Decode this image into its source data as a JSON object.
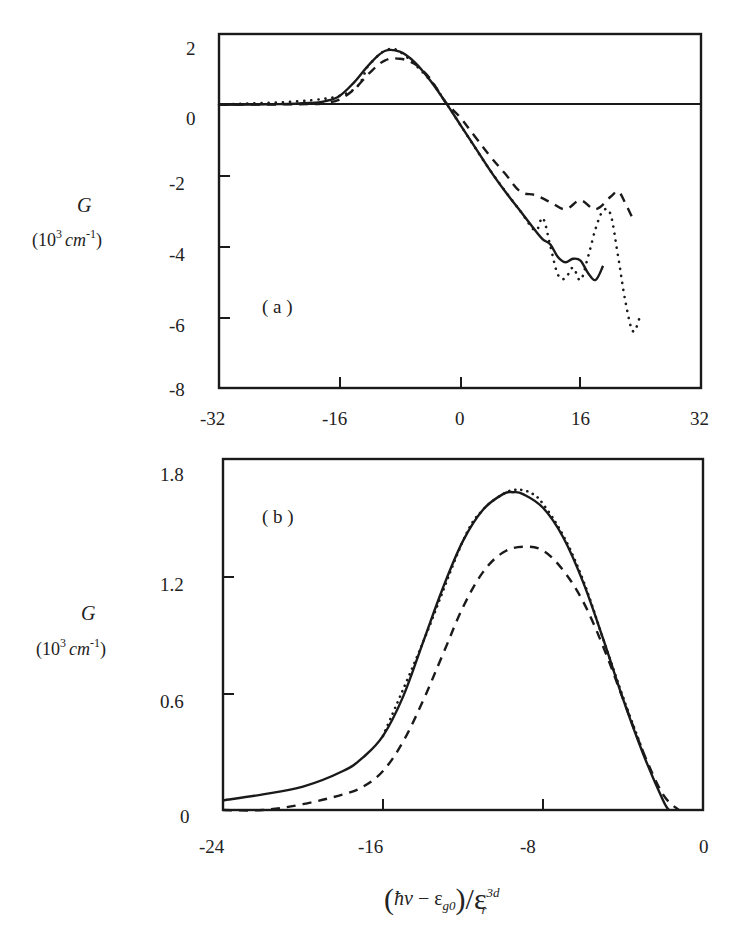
{
  "figure": {
    "panel_a": {
      "tag": "( a )",
      "ylabel_symbol": "G",
      "ylabel_unit_prefix": "(10",
      "ylabel_unit_exp": "3",
      "ylabel_unit_mid": "cm",
      "ylabel_unit_exp2": "-1",
      "ylabel_unit_suffix": ")",
      "xticks": [
        "-32",
        "-16",
        "0",
        "16",
        "32"
      ],
      "yticks": [
        "2",
        "0",
        "-2",
        "-4",
        "-6",
        "-8"
      ]
    },
    "panel_b": {
      "tag": "( b )",
      "ylabel_symbol": "G",
      "ylabel_unit_prefix": "(10",
      "ylabel_unit_exp": "3",
      "ylabel_unit_mid": "cm",
      "ylabel_unit_exp2": "-1",
      "ylabel_unit_suffix": ")",
      "xticks": [
        "-24",
        "-16",
        "-8",
        "0"
      ],
      "yticks": [
        "1.8",
        "1.2",
        "0.6",
        "0"
      ]
    },
    "xlabel": {
      "open": "(",
      "hbar_nu": "ħν",
      "minus": " − ε",
      "sub_g0": "g0",
      "close_div": ")/ε",
      "sup_3d": "3d",
      "sub_r": "r"
    },
    "line_color": "#1a1a1a"
  },
  "chart_data": [
    {
      "panel": "a",
      "type": "line",
      "title": "",
      "xlabel": "(ħν − ε_g0)/ε_r^3d",
      "ylabel": "G (10^3 cm^-1)",
      "xlim": [
        -32,
        32
      ],
      "ylim": [
        -8,
        2
      ],
      "xticks": [
        -32,
        -16,
        0,
        16,
        32
      ],
      "yticks": [
        2,
        0,
        -2,
        -4,
        -6,
        -8
      ],
      "grid": false,
      "reference_line": {
        "y": 0,
        "style": "solid"
      },
      "annotation": "(a)",
      "series": [
        {
          "name": "solid",
          "style": "solid",
          "x": [
            -32,
            -24,
            -20,
            -18,
            -16,
            -14,
            -12,
            -10,
            -8,
            -6,
            -4,
            -2,
            0,
            2,
            4,
            6,
            8,
            10,
            11,
            12,
            13,
            14,
            15,
            16,
            17,
            18,
            19
          ],
          "y": [
            0,
            0.02,
            0.05,
            0.1,
            0.25,
            0.65,
            1.15,
            1.52,
            1.5,
            1.2,
            0.7,
            0.1,
            -0.55,
            -1.2,
            -1.85,
            -2.45,
            -3.0,
            -3.55,
            -3.8,
            -3.95,
            -4.3,
            -4.45,
            -4.35,
            -4.4,
            -4.75,
            -4.95,
            -4.55
          ]
        },
        {
          "name": "dashed",
          "style": "dashed",
          "x": [
            -32,
            -20,
            -18,
            -16,
            -14,
            -12,
            -10,
            -8,
            -6,
            -4,
            -2,
            0,
            2,
            4,
            6,
            8,
            10,
            12,
            14,
            16,
            18,
            20,
            21,
            22,
            23
          ],
          "y": [
            0,
            0.02,
            0.05,
            0.15,
            0.45,
            0.9,
            1.25,
            1.3,
            1.15,
            0.75,
            0.1,
            -0.35,
            -0.9,
            -1.45,
            -1.95,
            -2.45,
            -2.55,
            -2.75,
            -2.95,
            -2.7,
            -2.95,
            -2.6,
            -2.45,
            -2.8,
            -3.25
          ]
        },
        {
          "name": "dotted",
          "style": "dotted",
          "x": [
            -32,
            -16,
            -12,
            -10,
            -8,
            -4,
            -2,
            0,
            4,
            8,
            10,
            11,
            12,
            13,
            14,
            15,
            16,
            17,
            18,
            19,
            20,
            21,
            22,
            23,
            24
          ],
          "y": [
            0,
            0.25,
            1.15,
            1.52,
            1.5,
            0.7,
            0.1,
            -0.55,
            -1.85,
            -3.0,
            -3.55,
            -3.2,
            -4.0,
            -4.8,
            -4.9,
            -4.6,
            -4.95,
            -4.3,
            -3.5,
            -3.0,
            -3.1,
            -4.3,
            -5.6,
            -6.4,
            -5.9
          ]
        }
      ]
    },
    {
      "panel": "b",
      "type": "line",
      "title": "",
      "xlabel": "(ħν − ε_g0)/ε_r^3d",
      "ylabel": "G (10^3 cm^-1)",
      "xlim": [
        -24,
        0
      ],
      "ylim": [
        0,
        1.8
      ],
      "xticks": [
        -24,
        -16,
        -8,
        0
      ],
      "yticks": [
        0,
        0.6,
        1.2,
        1.8
      ],
      "grid": false,
      "annotation": "(b)",
      "series": [
        {
          "name": "solid",
          "style": "solid",
          "x": [
            -24,
            -22,
            -20,
            -18,
            -17,
            -16,
            -15,
            -14,
            -13,
            -12,
            -11,
            -10,
            -9.5,
            -9,
            -8,
            -7,
            -6,
            -5,
            -4,
            -3,
            -2,
            -1.7
          ],
          "y": [
            0.05,
            0.08,
            0.12,
            0.2,
            0.27,
            0.38,
            0.58,
            0.86,
            1.14,
            1.38,
            1.54,
            1.62,
            1.63,
            1.62,
            1.55,
            1.4,
            1.17,
            0.88,
            0.57,
            0.29,
            0.05,
            0.0
          ]
        },
        {
          "name": "dashed",
          "style": "dashed",
          "x": [
            -24,
            -22,
            -20,
            -18,
            -17,
            -16,
            -15,
            -14,
            -13,
            -12,
            -11,
            -10,
            -9,
            -8,
            -7,
            -6,
            -5,
            -4,
            -3,
            -2,
            -1.2
          ],
          "y": [
            0.0,
            0.0,
            0.03,
            0.08,
            0.12,
            0.2,
            0.35,
            0.56,
            0.8,
            1.04,
            1.22,
            1.32,
            1.35,
            1.33,
            1.23,
            1.07,
            0.84,
            0.57,
            0.3,
            0.08,
            0.0
          ]
        },
        {
          "name": "dotted",
          "style": "dotted",
          "x": [
            -16,
            -14,
            -12,
            -11,
            -10,
            -9.5,
            -9,
            -8.5,
            -8,
            -7,
            -6,
            -5,
            -4,
            -3
          ],
          "y": [
            0.38,
            0.86,
            1.38,
            1.54,
            1.62,
            1.64,
            1.64,
            1.62,
            1.57,
            1.41,
            1.18,
            0.88,
            0.58,
            0.3
          ]
        }
      ]
    }
  ]
}
